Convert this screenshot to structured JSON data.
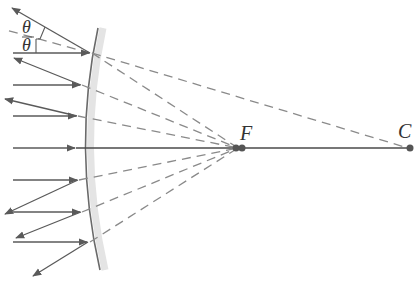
{
  "diagram": {
    "labels": {
      "focal_point": "F",
      "center_of_curvature": "C",
      "angle_incidence": "θ",
      "angle_reflection": "θ"
    },
    "colors": {
      "solid_ray": "#5a5a5a",
      "dashed_ray": "#8a8a8a",
      "mirror": "#6a6a6a",
      "mirror_shade": "#e4e4e4",
      "point": "#555555"
    },
    "points": {
      "F": [
        240,
        148
      ],
      "C": [
        410,
        148
      ]
    },
    "rays": [
      {
        "incoming_y": 53,
        "hit": [
          90,
          53
        ],
        "reflected_to": [
          12,
          8
        ]
      },
      {
        "incoming_y": 85,
        "hit": [
          81,
          85
        ],
        "reflected_to": [
          14,
          58
        ]
      },
      {
        "incoming_y": 116,
        "hit": [
          77,
          116
        ],
        "reflected_to": [
          5,
          99
        ]
      },
      {
        "incoming_y": 148,
        "hit": [
          76,
          148
        ],
        "reflected_to": null
      },
      {
        "incoming_y": 180,
        "hit": [
          78,
          180
        ],
        "reflected_to": [
          5,
          214
        ]
      },
      {
        "incoming_y": 212,
        "hit": [
          81,
          212
        ],
        "reflected_to": [
          16,
          238
        ]
      },
      {
        "incoming_y": 242,
        "hit": [
          88,
          242
        ],
        "reflected_to": [
          33,
          276
        ]
      }
    ]
  }
}
